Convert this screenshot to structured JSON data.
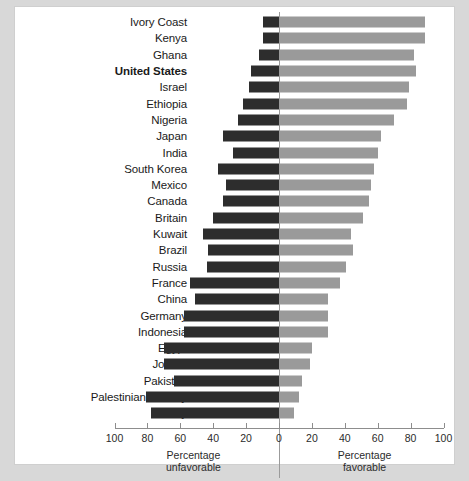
{
  "chart_data": {
    "type": "bar",
    "orientation": "horizontal",
    "layout": "diverging",
    "title": "",
    "xlabel": "",
    "ylabel": "",
    "grid": false,
    "legend_position": "none",
    "xlim": [
      -100,
      100
    ],
    "axis": {
      "zero_value": 0,
      "left_caption_line1": "Percentage",
      "left_caption_line2": "unfavorable",
      "right_caption_line1": "Percentage",
      "right_caption_line2": "favorable",
      "ticks_left": [
        100,
        80,
        60,
        40,
        20,
        0
      ],
      "ticks_right": [
        0,
        20,
        40,
        60,
        80,
        100
      ]
    },
    "colors": {
      "unfavorable": "#2d2d2d",
      "favorable": "#9a9a9a",
      "panel_background": "#ffffff",
      "page_background": "#d8d8d8",
      "axis": "#8d8d8d"
    },
    "series": [
      {
        "name": "Percentage unfavorable",
        "key": "unfavorable",
        "color": "#2d2d2d"
      },
      {
        "name": "Percentage favorable",
        "key": "favorable",
        "color": "#9a9a9a"
      }
    ],
    "categories": [
      "Ivory Coast",
      "Kenya",
      "Ghana",
      "United States",
      "Israel",
      "Ethiopia",
      "Nigeria",
      "Japan",
      "India",
      "South Korea",
      "Mexico",
      "Canada",
      "Britain",
      "Kuwait",
      "Brazil",
      "Russia",
      "France",
      "China",
      "Germany",
      "Indonesia",
      "Egypt",
      "Jordan",
      "Pakistan",
      "Palestinian territory",
      "Turkey"
    ],
    "highlighted_category": "United States",
    "rows": [
      {
        "label": "Ivory Coast",
        "unfavorable": 10,
        "favorable": 89,
        "bold": false
      },
      {
        "label": "Kenya",
        "unfavorable": 10,
        "favorable": 89,
        "bold": false
      },
      {
        "label": "Ghana",
        "unfavorable": 12,
        "favorable": 82,
        "bold": false
      },
      {
        "label": "United States",
        "unfavorable": 17,
        "favorable": 83,
        "bold": true
      },
      {
        "label": "Israel",
        "unfavorable": 18,
        "favorable": 79,
        "bold": false
      },
      {
        "label": "Ethiopia",
        "unfavorable": 22,
        "favorable": 78,
        "bold": false
      },
      {
        "label": "Nigeria",
        "unfavorable": 25,
        "favorable": 70,
        "bold": false
      },
      {
        "label": "Japan",
        "unfavorable": 34,
        "favorable": 62,
        "bold": false
      },
      {
        "label": "India",
        "unfavorable": 28,
        "favorable": 60,
        "bold": false
      },
      {
        "label": "South Korea",
        "unfavorable": 37,
        "favorable": 58,
        "bold": false
      },
      {
        "label": "Mexico",
        "unfavorable": 32,
        "favorable": 56,
        "bold": false
      },
      {
        "label": "Canada",
        "unfavorable": 34,
        "favorable": 55,
        "bold": false
      },
      {
        "label": "Britain",
        "unfavorable": 40,
        "favorable": 51,
        "bold": false
      },
      {
        "label": "Kuwait",
        "unfavorable": 46,
        "favorable": 44,
        "bold": false
      },
      {
        "label": "Brazil",
        "unfavorable": 43,
        "favorable": 45,
        "bold": false
      },
      {
        "label": "Russia",
        "unfavorable": 44,
        "favorable": 41,
        "bold": false
      },
      {
        "label": "France",
        "unfavorable": 54,
        "favorable": 37,
        "bold": false
      },
      {
        "label": "China",
        "unfavorable": 51,
        "favorable": 30,
        "bold": false
      },
      {
        "label": "Germany",
        "unfavorable": 58,
        "favorable": 30,
        "bold": false
      },
      {
        "label": "Indonesia",
        "unfavorable": 58,
        "favorable": 30,
        "bold": false
      },
      {
        "label": "Egypt",
        "unfavorable": 70,
        "favorable": 20,
        "bold": false
      },
      {
        "label": "Jordan",
        "unfavorable": 70,
        "favorable": 19,
        "bold": false
      },
      {
        "label": "Pakistan",
        "unfavorable": 64,
        "favorable": 14,
        "bold": false
      },
      {
        "label": "Palestinian territory",
        "unfavorable": 81,
        "favorable": 12,
        "bold": false
      },
      {
        "label": "Turkey",
        "unfavorable": 78,
        "favorable": 9,
        "bold": false
      }
    ]
  }
}
